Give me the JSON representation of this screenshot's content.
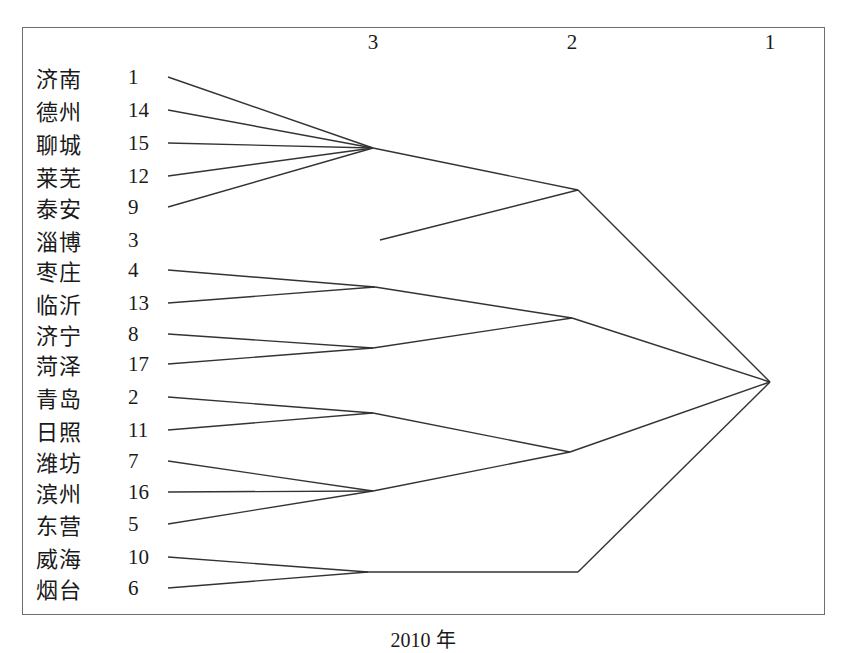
{
  "figure": {
    "caption": "2010 年",
    "axis_label_values": [
      "3",
      "2",
      "1"
    ]
  },
  "axis": {
    "ticks": [
      {
        "label": "3",
        "x": 373
      },
      {
        "label": "2",
        "x": 572
      },
      {
        "label": "1",
        "x": 770
      }
    ]
  },
  "leaves": [
    {
      "name": "济南",
      "index": "1",
      "y": 77
    },
    {
      "name": "德州",
      "index": "14",
      "y": 110
    },
    {
      "name": "聊城",
      "index": "15",
      "y": 143
    },
    {
      "name": "莱芜",
      "index": "12",
      "y": 176
    },
    {
      "name": "泰安",
      "index": "9",
      "y": 207
    },
    {
      "name": "淄博",
      "index": "3",
      "y": 240
    },
    {
      "name": "枣庄",
      "index": "4",
      "y": 270
    },
    {
      "name": "临沂",
      "index": "13",
      "y": 303
    },
    {
      "name": "济宁",
      "index": "8",
      "y": 334
    },
    {
      "name": "菏泽",
      "index": "17",
      "y": 364
    },
    {
      "name": "青岛",
      "index": "2",
      "y": 397
    },
    {
      "name": "日照",
      "index": "11",
      "y": 430
    },
    {
      "name": "潍坊",
      "index": "7",
      "y": 461
    },
    {
      "name": "滨州",
      "index": "16",
      "y": 492
    },
    {
      "name": "东营",
      "index": "5",
      "y": 524
    },
    {
      "name": "威海",
      "index": "10",
      "y": 557
    },
    {
      "name": "烟台",
      "index": "6",
      "y": 588
    }
  ],
  "chart_data": {
    "type": "dendrogram",
    "title": "2010 年",
    "xlabel": "",
    "ylabel": "",
    "axis_direction": "right-to-left",
    "axis_ticks": [
      3,
      2,
      1
    ],
    "leaf_order": [
      "济南",
      "德州",
      "聊城",
      "莱芜",
      "泰安",
      "淄博",
      "枣庄",
      "临沂",
      "济宁",
      "菏泽",
      "青岛",
      "日照",
      "潍坊",
      "滨州",
      "东营",
      "威海",
      "烟台"
    ],
    "leaf_indices": [
      1,
      14,
      15,
      12,
      9,
      3,
      4,
      13,
      8,
      17,
      2,
      11,
      7,
      16,
      5,
      10,
      6
    ],
    "clusters_at_stage_3": [
      [
        "济南",
        "德州",
        "聊城",
        "莱芜",
        "泰安"
      ],
      [
        "枣庄",
        "临沂"
      ],
      [
        "济宁",
        "菏泽"
      ],
      [
        "青岛",
        "日照"
      ],
      [
        "潍坊",
        "滨州",
        "东营"
      ],
      [
        "威海",
        "烟台"
      ]
    ],
    "clusters_at_stage_2": [
      [
        "济南",
        "德州",
        "聊城",
        "莱芜",
        "泰安",
        "淄博"
      ],
      [
        "枣庄",
        "临沂",
        "济宁",
        "菏泽"
      ],
      [
        "青岛",
        "日照",
        "潍坊",
        "滨州",
        "东营"
      ],
      [
        "威海",
        "烟台"
      ]
    ],
    "clusters_at_stage_1": [
      [
        "济南",
        "德州",
        "聊城",
        "莱芜",
        "泰安",
        "淄博",
        "枣庄",
        "临沂",
        "济宁",
        "菏泽",
        "青岛",
        "日照",
        "潍坊",
        "滨州",
        "东营",
        "威海",
        "烟台"
      ]
    ],
    "line_color": "#333333",
    "background": "#ffffff",
    "grid": false,
    "legend": false
  },
  "geometry": {
    "leaf_x": 168,
    "stage3_x": 373,
    "stage2_x": 574,
    "root_x": 770,
    "root_y": 382,
    "nodes": {
      "n_jinan_group": {
        "x": 373,
        "y": 148
      },
      "n_zaozhuang": {
        "x": 375,
        "y": 287
      },
      "n_jining": {
        "x": 373,
        "y": 348
      },
      "n_qingdao": {
        "x": 373,
        "y": 413
      },
      "n_weifang": {
        "x": 373,
        "y": 491
      },
      "n_weihai": {
        "x": 368,
        "y": 572
      },
      "n_north": {
        "x": 578,
        "y": 190
      },
      "n_southwest": {
        "x": 572,
        "y": 318
      },
      "n_east": {
        "x": 570,
        "y": 452
      },
      "n_peninsula": {
        "x": 578,
        "y": 572
      }
    },
    "zibo_line_start_x": 380
  }
}
